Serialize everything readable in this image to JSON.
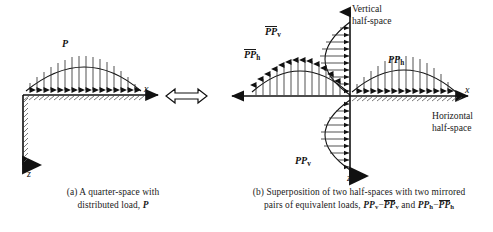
{
  "figure": {
    "panel_a": {
      "load_label": "P",
      "axis_x": "x",
      "axis_z": "z",
      "caption_prefix": "(a) A quarter-space with",
      "caption_line2_pre": "distributed load,",
      "caption_line2_sym": "P",
      "load_arrow_direction": "down",
      "load_profile": "semi-elliptical",
      "load_arrow_count": 16,
      "hatch_surfaces": [
        "top-horizontal",
        "left-vertical"
      ]
    },
    "equivalence_symbol": "⟺",
    "panel_b": {
      "axis_x": "x",
      "axis_z": "z",
      "label_ppbar_v": "PP",
      "label_ppbar_v_sub": "v",
      "label_ppbar_h": "PP",
      "label_ppbar_h_sub": "h",
      "label_pp_h": "PP",
      "label_pp_h_sub": "h",
      "label_pp_v": "PP",
      "label_pp_v_sub": "v",
      "vertical_space_line1": "Vertical",
      "vertical_space_line2": "half-space",
      "horizontal_space_line1": "Horizontal",
      "horizontal_space_line2": "half-space",
      "caption_prefix": "(b) Superposition of two half-spaces with two mirrored",
      "caption_line2_pre": "pairs of equivalent loads,",
      "caption_sym_1": "PP",
      "caption_sym_1_sub": "v",
      "caption_minus": "−",
      "caption_sym_2": "PP",
      "caption_sym_2_sub": "v",
      "caption_and": "and",
      "caption_sym_3": "PP",
      "caption_sym_3_sub": "h",
      "caption_sym_4": "PP",
      "caption_sym_4_sub": "h",
      "quadrant_loads": [
        {
          "name": "upper-vertical",
          "label": "PPbar_v",
          "arrows": "right",
          "side": "left-of-z-up"
        },
        {
          "name": "left-horizontal",
          "label": "PPbar_h",
          "arrows": "up",
          "side": "above-x-left"
        },
        {
          "name": "right-horizontal",
          "label": "PP_h",
          "arrows": "down",
          "side": "above-x-right"
        },
        {
          "name": "lower-vertical",
          "label": "PP_v",
          "arrows": "right",
          "side": "left-of-z-down"
        }
      ]
    }
  },
  "colors": {
    "ink": "#1a1a1a",
    "line": "#111111",
    "background": "#ffffff"
  }
}
